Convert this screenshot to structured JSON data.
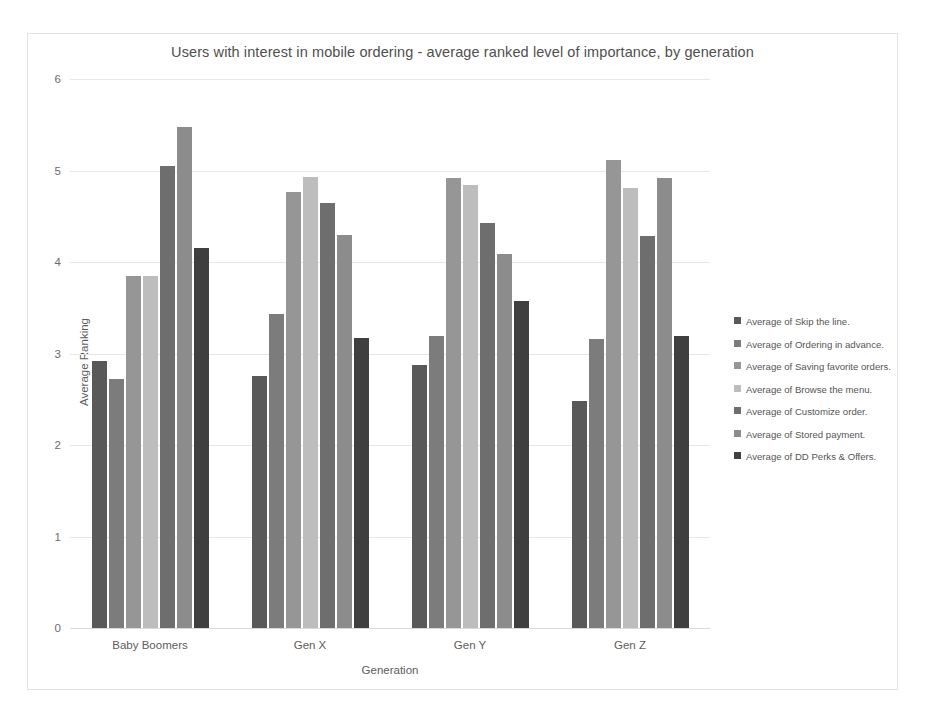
{
  "chart_data": {
    "type": "bar",
    "title": "Users with interest in mobile ordering - average ranked level of importance, by generation",
    "xlabel": "Generation",
    "ylabel": "Average Ranking",
    "ylim": [
      0,
      6
    ],
    "yticks": [
      0,
      1,
      2,
      3,
      4,
      5,
      6
    ],
    "grid": true,
    "legend_position": "right",
    "categories": [
      "Baby Boomers",
      "Gen X",
      "Gen Y",
      "Gen Z"
    ],
    "series": [
      {
        "name": "Average of Skip the line.",
        "color": "#595959",
        "values": [
          2.92,
          2.75,
          2.87,
          2.48
        ]
      },
      {
        "name": "Average of Ordering in advance.",
        "color": "#7c7c7c",
        "values": [
          2.72,
          3.43,
          3.19,
          3.16
        ]
      },
      {
        "name": "Average of Saving favorite orders.",
        "color": "#969696",
        "values": [
          3.85,
          4.76,
          4.92,
          5.11
        ]
      },
      {
        "name": "Average of Browse the menu.",
        "color": "#bdbdbd",
        "values": [
          3.85,
          4.93,
          4.84,
          4.81
        ]
      },
      {
        "name": "Average of Customize order.",
        "color": "#6e6e6e",
        "values": [
          5.05,
          4.64,
          4.43,
          4.28
        ]
      },
      {
        "name": "Average of Stored payment.",
        "color": "#8c8c8c",
        "values": [
          5.48,
          4.29,
          4.09,
          4.92
        ]
      },
      {
        "name": "Average of DD Perks & Offers.",
        "color": "#3f3f3f",
        "values": [
          4.15,
          3.17,
          3.57,
          3.19
        ]
      }
    ]
  }
}
